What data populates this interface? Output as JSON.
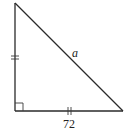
{
  "diagram": {
    "type": "right-triangle",
    "vertices": {
      "top": [
        15,
        3
      ],
      "right_angle": [
        15,
        111
      ],
      "bottom_right": [
        123,
        111
      ]
    },
    "labels": {
      "hypotenuse": "a",
      "base": "72"
    },
    "markers": {
      "right_angle": true,
      "left_leg_ticks": 2,
      "base_ticks": 2
    },
    "colors": {
      "stroke": "#2a2a2a",
      "background": "#ffffff"
    }
  }
}
